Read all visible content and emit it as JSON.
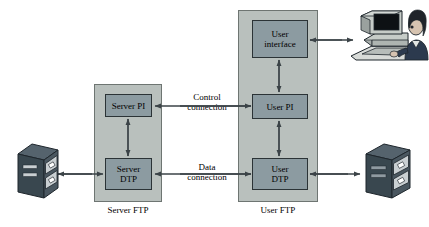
{
  "diagram": {
    "colors": {
      "container_fill": "#b9c0bd",
      "container_stroke": "#6e7572",
      "box_fill": "#8c9ba1",
      "box_stroke": "#2b3336",
      "arrow": "#3b4347",
      "storage_dark": "#3d4b55",
      "storage_light": "#c9cfd2",
      "background": "#ffffff"
    },
    "server_side": {
      "caption": "Server FTP",
      "boxes": [
        {
          "id": "server-pi",
          "label": "Server PI"
        },
        {
          "id": "server-dtp",
          "label": "Server\nDTP"
        }
      ]
    },
    "user_side": {
      "caption": "User FTP",
      "boxes": [
        {
          "id": "user-interface",
          "label": "User\ninterface"
        },
        {
          "id": "user-pi",
          "label": "User PI"
        },
        {
          "id": "user-dtp",
          "label": "User\nDTP"
        }
      ]
    },
    "connections": [
      {
        "id": "control-connection",
        "label": "Control\nconnection"
      },
      {
        "id": "data-connection",
        "label": "Data\nconnection"
      }
    ],
    "endpoints": [
      {
        "id": "server-file-storage",
        "icon": "file-cabinet-icon"
      },
      {
        "id": "user-file-storage",
        "icon": "file-cabinet-icon"
      },
      {
        "id": "user-terminal",
        "icon": "user-at-computer-icon"
      }
    ]
  }
}
